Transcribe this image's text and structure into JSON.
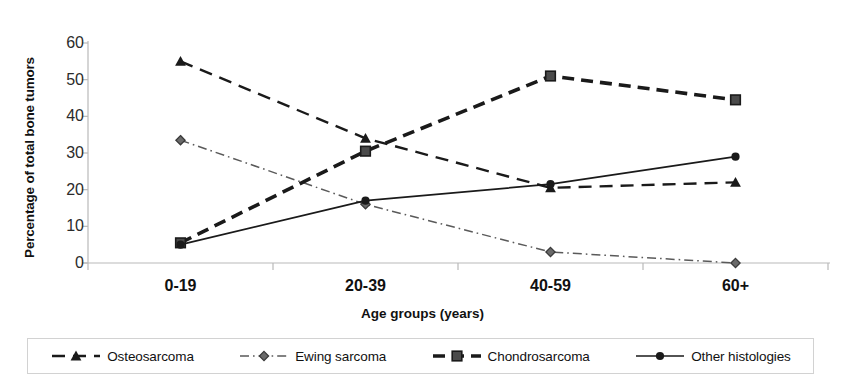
{
  "chart_data": {
    "type": "line",
    "title": "",
    "xlabel": "Age groups (years)",
    "ylabel": "Percentage of total bone tumors",
    "categories": [
      "0-19",
      "20-39",
      "40-59",
      "60+"
    ],
    "ylim": [
      0,
      60
    ],
    "yticks": [
      0,
      10,
      20,
      30,
      40,
      50,
      60
    ],
    "grid": false,
    "legend_position": "bottom",
    "series": [
      {
        "name": "Osteosarcoma",
        "values": [
          55,
          34,
          20.5,
          22
        ],
        "marker": "triangle",
        "line_style": "dashed",
        "color": "#1a1a1a"
      },
      {
        "name": "Ewing sarcoma",
        "values": [
          33.5,
          16,
          3,
          0
        ],
        "marker": "diamond",
        "line_style": "dash-dot",
        "color": "#5a5a5a"
      },
      {
        "name": "Chondrosarcoma",
        "values": [
          5.5,
          30.5,
          51,
          44.5
        ],
        "marker": "square",
        "line_style": "thick-dashed",
        "color": "#1a1a1a"
      },
      {
        "name": "Other histologies",
        "values": [
          5,
          17,
          21.5,
          29
        ],
        "marker": "circle",
        "line_style": "solid",
        "color": "#1a1a1a"
      }
    ]
  },
  "axis": {
    "y_tick_labels": [
      "0",
      "10",
      "20",
      "30",
      "40",
      "50",
      "60"
    ],
    "x_tick_labels": [
      "0-19",
      "20-39",
      "40-59",
      "60+"
    ],
    "x_title": "Age groups (years)",
    "y_title": "Percentage of total bone tumors"
  },
  "legend": {
    "items": [
      {
        "label": "Osteosarcoma",
        "marker": "triangle-marker"
      },
      {
        "label": "Ewing sarcoma",
        "marker": "diamond-marker"
      },
      {
        "label": "Chondrosarcoma",
        "marker": "square-marker"
      },
      {
        "label": "Other histologies",
        "marker": "circle-marker"
      }
    ]
  }
}
